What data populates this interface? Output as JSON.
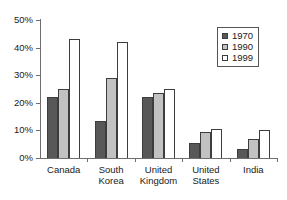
{
  "chart_data": {
    "type": "bar",
    "title": "",
    "subtitle": "",
    "xlabel": "",
    "ylabel": "",
    "ylim": [
      0,
      50
    ],
    "ytick_values": [
      0,
      10,
      20,
      30,
      40,
      50
    ],
    "ytick_labels": [
      "0%",
      "10%",
      "20%",
      "30%",
      "40%",
      "50%"
    ],
    "grid": false,
    "legend_position": "top-right",
    "categories": [
      "Canada",
      "South Korea",
      "United Kingdom",
      "United States",
      "India"
    ],
    "series": [
      {
        "name": "1970",
        "color": "#585858",
        "values": [
          22,
          13.5,
          22,
          5.5,
          3.3
        ]
      },
      {
        "name": "1990",
        "color": "#c2c2c2",
        "values": [
          25,
          29,
          23.5,
          9.5,
          7
        ]
      },
      {
        "name": "1999",
        "color": "#ffffff",
        "values": [
          43,
          42,
          25,
          10.5,
          10
        ]
      }
    ]
  },
  "axes": {
    "y_axis_name": "percent-axis",
    "x_axis_name": "country-axis"
  }
}
